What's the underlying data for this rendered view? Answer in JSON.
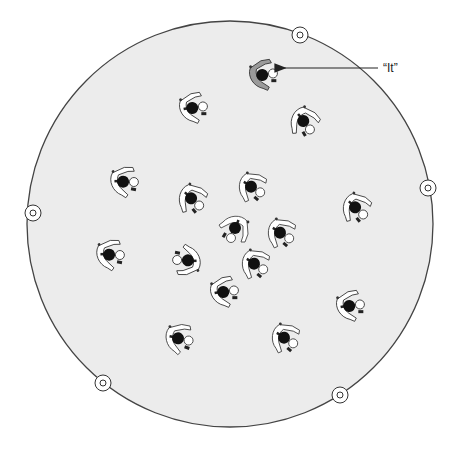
{
  "diagram": {
    "field": {
      "cx": 230,
      "cy": 224,
      "r": 203,
      "fill": "#ececec",
      "stroke": "#444444"
    },
    "markers": [
      {
        "name": "marker-top",
        "x": 300,
        "y": 35
      },
      {
        "name": "marker-right",
        "x": 428,
        "y": 188
      },
      {
        "name": "marker-bottom-right",
        "x": 340,
        "y": 395
      },
      {
        "name": "marker-bottom-left",
        "x": 103,
        "y": 383
      },
      {
        "name": "marker-left",
        "x": 33,
        "y": 213
      }
    ],
    "it_label": {
      "text": "“It”",
      "x": 383,
      "y": 72
    },
    "arrow": {
      "x1": 378,
      "y1": 68,
      "x2": 284,
      "y2": 68
    },
    "it_player": {
      "x": 264,
      "y": 74,
      "rot": -30,
      "shirt": "#9a9a9a"
    },
    "players": [
      {
        "x": 194,
        "y": 107,
        "rot": -30
      },
      {
        "x": 305,
        "y": 122,
        "rot": 30
      },
      {
        "x": 125,
        "y": 181,
        "rot": -20
      },
      {
        "x": 193,
        "y": 199,
        "rot": 20
      },
      {
        "x": 253,
        "y": 187,
        "rot": 10
      },
      {
        "x": 357,
        "y": 208,
        "rot": 20
      },
      {
        "x": 235,
        "y": 230,
        "rot": 90
      },
      {
        "x": 282,
        "y": 233,
        "rot": 10
      },
      {
        "x": 111,
        "y": 254,
        "rot": -20
      },
      {
        "x": 186,
        "y": 261,
        "rot": 160
      },
      {
        "x": 256,
        "y": 264,
        "rot": 10
      },
      {
        "x": 225,
        "y": 291,
        "rot": -30
      },
      {
        "x": 351,
        "y": 305,
        "rot": -30
      },
      {
        "x": 180,
        "y": 338,
        "rot": -10
      },
      {
        "x": 286,
        "y": 338,
        "rot": 10
      }
    ]
  }
}
